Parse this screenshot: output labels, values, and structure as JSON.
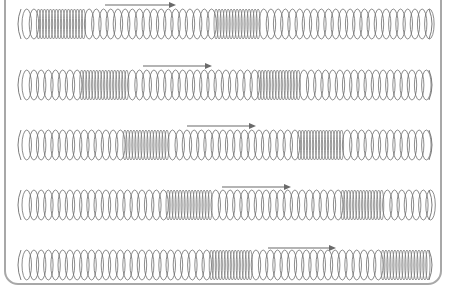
{
  "diagram": {
    "type": "longitudinal-wave-spring-sequence",
    "colors": {
      "coil": "#6e6e6e",
      "arrow": "#6a6a6a",
      "frame": "#a8a8a8",
      "background": "#ffffff"
    },
    "spring": {
      "x_start": 18,
      "x_end": 432,
      "coil_height": 30,
      "loose_pitch": 7.2,
      "tight_pitch": 3.0
    },
    "rows": [
      {
        "id": 1,
        "center_y": 24,
        "arrow": {
          "x1": 105,
          "x2": 176,
          "y": 5
        },
        "compressions": [
          [
            30,
            82
          ],
          [
            208,
            258
          ]
        ]
      },
      {
        "id": 2,
        "center_y": 85,
        "arrow": {
          "x1": 143,
          "x2": 212,
          "y": 66
        },
        "compressions": [
          [
            77,
            125
          ],
          [
            250,
            298
          ]
        ]
      },
      {
        "id": 3,
        "center_y": 145,
        "arrow": {
          "x1": 187,
          "x2": 256,
          "y": 126
        },
        "compressions": [
          [
            118,
            165
          ],
          [
            292,
            340
          ]
        ]
      },
      {
        "id": 4,
        "center_y": 205,
        "arrow": {
          "x1": 222,
          "x2": 291,
          "y": 187
        },
        "compressions": [
          [
            162,
            208
          ],
          [
            335,
            382
          ]
        ]
      },
      {
        "id": 5,
        "center_y": 265,
        "arrow": {
          "x1": 268,
          "x2": 336,
          "y": 248
        },
        "compressions": [
          [
            204,
            250
          ],
          [
            378,
            427
          ]
        ]
      }
    ]
  }
}
